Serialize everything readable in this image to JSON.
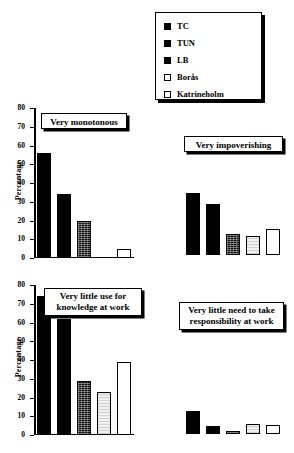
{
  "legend": {
    "name": "chart-legend",
    "entries": [
      {
        "label": "TC",
        "style": "solid"
      },
      {
        "label": "TUN",
        "style": "solid"
      },
      {
        "label": "LB",
        "style": "solid"
      },
      {
        "label": "Borås",
        "style": "lgray"
      },
      {
        "label": "Katrineholm",
        "style": "white"
      }
    ]
  },
  "axis": {
    "ylabel": "Percentage",
    "ticks": [
      "0",
      "10",
      "20",
      "30",
      "40",
      "50",
      "60",
      "70",
      "80"
    ]
  },
  "charts": [
    {
      "title": "Very monotonous"
    },
    {
      "title": "Very impoverishing"
    },
    {
      "title": "Very little use for\nknowledge at work"
    },
    {
      "title": "Very little need to take\nresponsibility at work"
    }
  ],
  "chart_data": [
    {
      "type": "bar",
      "title": "Very monotonous",
      "xlabel": "",
      "ylabel": "Percentage",
      "ylim": [
        0,
        80
      ],
      "yticks": [
        0,
        10,
        20,
        30,
        40,
        50,
        60,
        70,
        80
      ],
      "grid": false,
      "axis_visible": true,
      "legend_position": "top-right (shared)",
      "categories": [
        "TC",
        "TUN",
        "LB",
        "Borås",
        "Katrineholm"
      ],
      "values": [
        56,
        34,
        20,
        0,
        5
      ]
    },
    {
      "type": "bar",
      "title": "Very impoverishing",
      "xlabel": "",
      "ylabel": "",
      "ylim": [
        0,
        80
      ],
      "yticks": [],
      "grid": false,
      "axis_visible": false,
      "legend_position": "top-right (shared)",
      "categories": [
        "TC",
        "TUN",
        "LB",
        "Borås",
        "Katrineholm"
      ],
      "values": [
        52,
        43,
        18,
        16,
        22
      ]
    },
    {
      "type": "bar",
      "title": "Very little use for knowledge at work",
      "xlabel": "",
      "ylabel": "Percentage",
      "ylim": [
        0,
        80
      ],
      "yticks": [
        0,
        10,
        20,
        30,
        40,
        50,
        60,
        70,
        80
      ],
      "grid": false,
      "axis_visible": true,
      "legend_position": "top-right (shared)",
      "categories": [
        "TC",
        "TUN",
        "LB",
        "Borås",
        "Katrineholm"
      ],
      "values": [
        74,
        62,
        29,
        23,
        39
      ]
    },
    {
      "type": "bar",
      "title": "Very little need to take responsibility at work",
      "xlabel": "",
      "ylabel": "",
      "ylim": [
        0,
        80
      ],
      "yticks": [],
      "grid": false,
      "axis_visible": false,
      "legend_position": "top-right (shared)",
      "categories": [
        "TC",
        "TUN",
        "LB",
        "Borås",
        "Katrineholm"
      ],
      "values": [
        30,
        10,
        4,
        13,
        12
      ]
    }
  ]
}
